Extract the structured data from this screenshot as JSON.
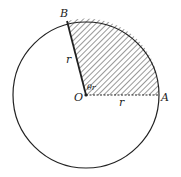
{
  "diagram": {
    "labels": {
      "A": "A",
      "B": "B",
      "O": "O",
      "r_OB": "r",
      "r_OA": "r",
      "angle": "θr"
    },
    "colors": {
      "stroke": "#222222",
      "hatch": "#333333",
      "background": "#ffffff"
    }
  }
}
